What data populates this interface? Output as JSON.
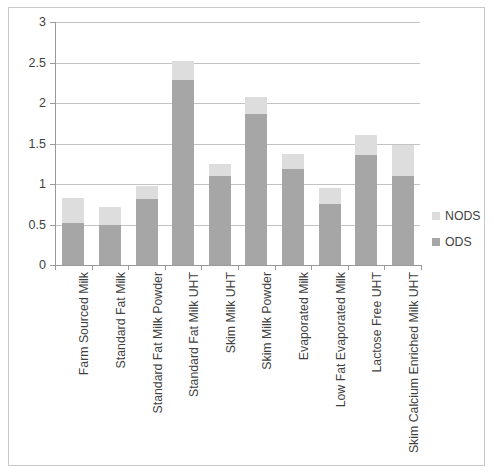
{
  "chart_data": {
    "type": "bar",
    "subtype": "stacked-column",
    "title": "",
    "xlabel": "",
    "ylabel": "",
    "ylim": [
      0,
      3
    ],
    "ytick_step": 0.5,
    "ytick_labels": [
      "3",
      "2.5",
      "2",
      "1.5",
      "1",
      "0.5",
      "0"
    ],
    "ytick_values": [
      3,
      2.5,
      2,
      1.5,
      1,
      0.5,
      0
    ],
    "grid": true,
    "legend_position": "right",
    "categories": [
      "Farm Sourced Milk",
      "Standard Fat Milk",
      "Standard Fat Milk Powder",
      "Standard Fat Milk UHT",
      "Skim Milk UHT",
      "Skim Milk Powder",
      "Evaporated Milk",
      "Low Fat Evaporated Milk",
      "Lactose Free UHT",
      "Skim Calcium Enriched Milk UHT"
    ],
    "series": [
      {
        "name": "ODS",
        "color": "#a6a6a6",
        "values": [
          0.52,
          0.5,
          0.81,
          2.29,
          1.1,
          1.86,
          1.19,
          0.75,
          1.36,
          1.1
        ]
      },
      {
        "name": "NODS",
        "color": "#dddddd",
        "values": [
          0.31,
          0.22,
          0.16,
          0.23,
          0.15,
          0.22,
          0.18,
          0.2,
          0.25,
          0.38
        ]
      }
    ],
    "totals": [
      0.83,
      0.72,
      0.97,
      2.52,
      1.25,
      2.08,
      1.37,
      0.95,
      1.61,
      1.48
    ]
  },
  "legend": {
    "items": [
      {
        "label": "NODS",
        "color": "#dddddd"
      },
      {
        "label": "ODS",
        "color": "#a6a6a6"
      }
    ]
  }
}
